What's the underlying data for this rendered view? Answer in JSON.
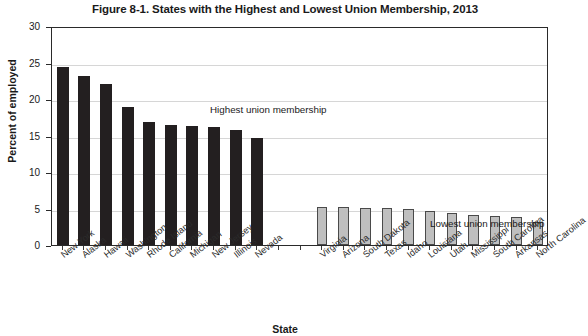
{
  "chart_data": {
    "type": "bar",
    "title": "Figure 8-1. States with the Highest and Lowest Union Membership, 2013",
    "xlabel": "State",
    "ylabel": "Percent of employed",
    "ylim": [
      0,
      30
    ],
    "ytick_labels": [
      "0",
      "5",
      "10",
      "15",
      "20",
      "25",
      "30"
    ],
    "ytick_values": [
      0,
      5,
      10,
      15,
      20,
      25,
      30
    ],
    "grid": true,
    "legend_position": "none",
    "annotations": [
      {
        "text": "Highest union membership",
        "target": "high-group"
      },
      {
        "text": "Lowest union membership",
        "target": "low-group"
      }
    ],
    "categories": [
      "New York",
      "Alaska",
      "Hawaii",
      "Washington",
      "Rhode Island",
      "California",
      "Michigan",
      "New Jersey",
      "Illinois",
      "Nevada",
      "",
      "",
      "Virginia",
      "Arizona",
      "South Dakota",
      "Texas",
      "Idaho",
      "Louisiana",
      "Utah",
      "Mississippi",
      "South Carolina",
      "Arkansas",
      "North Carolina"
    ],
    "values": [
      24.4,
      23.1,
      22.1,
      18.9,
      16.9,
      16.4,
      16.3,
      16.1,
      15.7,
      14.6,
      null,
      null,
      5.2,
      5.2,
      5.1,
      5.1,
      4.9,
      4.6,
      4.4,
      4.1,
      4.0,
      3.9,
      3.2
    ],
    "groups": [
      {
        "name": "Highest union membership",
        "color": "#231f20",
        "categories": [
          "New York",
          "Alaska",
          "Hawaii",
          "Washington",
          "Rhode Island",
          "California",
          "Michigan",
          "New Jersey",
          "Illinois",
          "Nevada"
        ],
        "values": [
          24.4,
          23.1,
          22.1,
          18.9,
          16.9,
          16.4,
          16.3,
          16.1,
          15.7,
          14.6
        ]
      },
      {
        "name": "Lowest union membership",
        "color": "#bfbfbf",
        "categories": [
          "Virginia",
          "Arizona",
          "South Dakota",
          "Texas",
          "Idaho",
          "Louisiana",
          "Utah",
          "Mississippi",
          "South Carolina",
          "Arkansas",
          "North Carolina"
        ],
        "values": [
          5.2,
          5.2,
          5.1,
          5.1,
          4.9,
          4.6,
          4.4,
          4.1,
          4.0,
          3.9,
          3.2
        ]
      }
    ]
  }
}
